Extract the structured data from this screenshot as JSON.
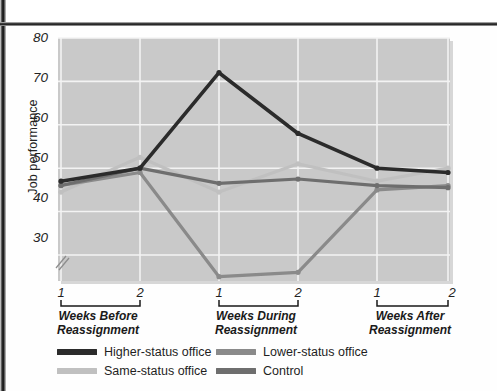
{
  "figure": {
    "background": "#ffffff",
    "plot_background": "#c9c9c9",
    "gridline_color": "#f2f2f2"
  },
  "chart_data": {
    "type": "line",
    "title": "",
    "xlabel": "",
    "ylabel": "Job performance",
    "ylim": [
      24,
      80
    ],
    "yticks": [
      30,
      40,
      50,
      60,
      70,
      80
    ],
    "ytick_labels": [
      "30",
      "40",
      "50",
      "60",
      "70",
      "80"
    ],
    "y_axis_break": true,
    "grid": true,
    "legend_position": "below-axes",
    "x_groups": [
      {
        "label": "Weeks Before\nReassignment",
        "line1": "Weeks Before",
        "line2": "Reassignment",
        "ticks": [
          "1",
          "2"
        ]
      },
      {
        "label": "Weeks During\nReassignment",
        "line1": "Weeks During",
        "line2": "Reassignment",
        "ticks": [
          "1",
          "2"
        ]
      },
      {
        "label": "Weeks After\nReassignment",
        "line1": "Weeks After",
        "line2": "Reassignment",
        "ticks": [
          "1",
          "2"
        ]
      }
    ],
    "x": [
      "Before 1",
      "Before 2",
      "During 1",
      "During 2",
      "After 1",
      "After 2"
    ],
    "series": [
      {
        "name": "Higher-status office",
        "color": "#2b2b2b",
        "values": [
          47,
          50,
          72,
          58,
          50,
          49
        ]
      },
      {
        "name": "Lower-status office",
        "color": "#8a8a8a",
        "values": [
          46,
          49,
          25,
          26,
          45,
          46
        ]
      },
      {
        "name": "Same-status office",
        "color": "#c0c0c0",
        "values": [
          44.5,
          52.5,
          44.5,
          51,
          47,
          50
        ]
      },
      {
        "name": "Control",
        "color": "#6e6e6e",
        "values": [
          46,
          50,
          46.5,
          47.5,
          46,
          45.5
        ]
      }
    ]
  },
  "legend": {
    "entries": [
      {
        "label": "Higher-status office",
        "color": "#2b2b2b"
      },
      {
        "label": "Lower-status office",
        "color": "#8a8a8a"
      },
      {
        "label": "Same-status office",
        "color": "#c0c0c0"
      },
      {
        "label": "Control",
        "color": "#6e6e6e"
      }
    ]
  }
}
